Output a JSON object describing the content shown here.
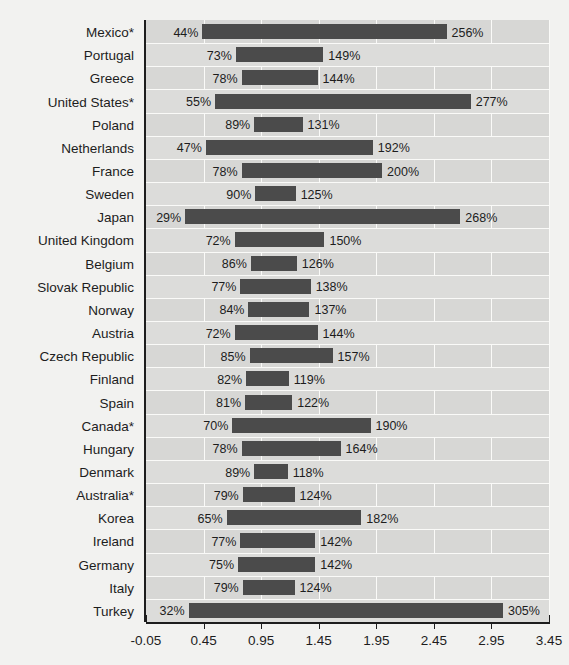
{
  "chart_data": {
    "type": "bar",
    "subtype": "floating-range-bar",
    "title": "",
    "xlabel": "",
    "ylabel": "",
    "xlim": [
      -0.05,
      3.45
    ],
    "xticks": [
      "-0.05",
      "0.45",
      "0.95",
      "1.45",
      "1.95",
      "2.45",
      "2.95",
      "3.45"
    ],
    "xtick_values": [
      -0.05,
      0.45,
      0.95,
      1.45,
      1.95,
      2.45,
      2.95,
      3.45
    ],
    "grid": true,
    "legend": "none",
    "value_suffix": "%",
    "categories": [
      "Mexico*",
      "Portugal",
      "Greece",
      "United States*",
      "Poland",
      "Netherlands",
      "France",
      "Sweden",
      "Japan",
      "United Kingdom",
      "Belgium",
      "Slovak Republic",
      "Norway",
      "Austria",
      "Czech Republic",
      "Finland",
      "Spain",
      "Canada*",
      "Hungary",
      "Denmark",
      "Australia*",
      "Korea",
      "Ireland",
      "Germany",
      "Italy",
      "Turkey"
    ],
    "series": [
      {
        "name": "start",
        "values": [
          44,
          73,
          78,
          55,
          89,
          47,
          78,
          90,
          29,
          72,
          86,
          77,
          84,
          72,
          85,
          82,
          81,
          70,
          78,
          89,
          79,
          65,
          77,
          75,
          79,
          32
        ]
      },
      {
        "name": "end",
        "values": [
          256,
          149,
          144,
          277,
          131,
          192,
          200,
          125,
          268,
          150,
          126,
          138,
          137,
          144,
          157,
          119,
          122,
          190,
          164,
          118,
          124,
          182,
          142,
          142,
          124,
          305
        ]
      }
    ],
    "rows": [
      {
        "label": "Mexico*",
        "start": 44,
        "end": 256,
        "start_text": "44%",
        "end_text": "256%"
      },
      {
        "label": "Portugal",
        "start": 73,
        "end": 149,
        "start_text": "73%",
        "end_text": "149%"
      },
      {
        "label": "Greece",
        "start": 78,
        "end": 144,
        "start_text": "78%",
        "end_text": "144%"
      },
      {
        "label": "United States*",
        "start": 55,
        "end": 277,
        "start_text": "55%",
        "end_text": "277%"
      },
      {
        "label": "Poland",
        "start": 89,
        "end": 131,
        "start_text": "89%",
        "end_text": "131%"
      },
      {
        "label": "Netherlands",
        "start": 47,
        "end": 192,
        "start_text": "47%",
        "end_text": "192%"
      },
      {
        "label": "France",
        "start": 78,
        "end": 200,
        "start_text": "78%",
        "end_text": "200%"
      },
      {
        "label": "Sweden",
        "start": 90,
        "end": 125,
        "start_text": "90%",
        "end_text": "125%"
      },
      {
        "label": "Japan",
        "start": 29,
        "end": 268,
        "start_text": "29%",
        "end_text": "268%"
      },
      {
        "label": "United Kingdom",
        "start": 72,
        "end": 150,
        "start_text": "72%",
        "end_text": "150%"
      },
      {
        "label": "Belgium",
        "start": 86,
        "end": 126,
        "start_text": "86%",
        "end_text": "126%"
      },
      {
        "label": "Slovak Republic",
        "start": 77,
        "end": 138,
        "start_text": "77%",
        "end_text": "138%"
      },
      {
        "label": "Norway",
        "start": 84,
        "end": 137,
        "start_text": "84%",
        "end_text": "137%"
      },
      {
        "label": "Austria",
        "start": 72,
        "end": 144,
        "start_text": "72%",
        "end_text": "144%"
      },
      {
        "label": "Czech Republic",
        "start": 85,
        "end": 157,
        "start_text": "85%",
        "end_text": "157%"
      },
      {
        "label": "Finland",
        "start": 82,
        "end": 119,
        "start_text": "82%",
        "end_text": "119%"
      },
      {
        "label": "Spain",
        "start": 81,
        "end": 122,
        "start_text": "81%",
        "end_text": "122%"
      },
      {
        "label": "Canada*",
        "start": 70,
        "end": 190,
        "start_text": "70%",
        "end_text": "190%"
      },
      {
        "label": "Hungary",
        "start": 78,
        "end": 164,
        "start_text": "78%",
        "end_text": "164%"
      },
      {
        "label": "Denmark",
        "start": 89,
        "end": 118,
        "start_text": "89%",
        "end_text": "118%"
      },
      {
        "label": "Australia*",
        "start": 79,
        "end": 124,
        "start_text": "79%",
        "end_text": "124%"
      },
      {
        "label": "Korea",
        "start": 65,
        "end": 182,
        "start_text": "65%",
        "end_text": "182%"
      },
      {
        "label": "Ireland",
        "start": 77,
        "end": 142,
        "start_text": "77%",
        "end_text": "142%"
      },
      {
        "label": "Germany",
        "start": 75,
        "end": 142,
        "start_text": "75%",
        "end_text": "142%"
      },
      {
        "label": "Italy",
        "start": 79,
        "end": 124,
        "start_text": "79%",
        "end_text": "124%"
      },
      {
        "label": "Turkey",
        "start": 32,
        "end": 305,
        "start_text": "32%",
        "end_text": "305%"
      }
    ],
    "colors": {
      "bar": "#4b4b4b",
      "plot_background": "#d7d7d5",
      "page_background": "#f2f2f0",
      "gridline": "#fafaf8",
      "axis": "#1d1d1d",
      "text": "#1d1d1d"
    }
  }
}
